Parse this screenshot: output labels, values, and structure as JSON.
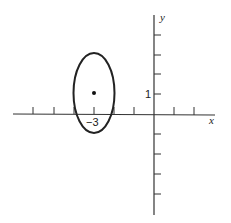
{
  "diagram": {
    "type": "coordinate-plot",
    "axes": {
      "x_label": "x",
      "y_label": "y",
      "x_ticks": [
        -7,
        -6,
        -5,
        -4,
        -3,
        -2,
        -1,
        1,
        2
      ],
      "y_ticks": [
        -5,
        -4,
        -3,
        -2,
        -1,
        1,
        2,
        3,
        4
      ],
      "labeled_x_tick": "−3",
      "labeled_y_tick": "1"
    },
    "ellipse": {
      "center": [
        -3,
        1
      ],
      "semi_axis_x": 1,
      "semi_axis_y": 2,
      "center_marked": true
    },
    "colors": {
      "stroke": "#222222",
      "background": "#ffffff"
    }
  }
}
